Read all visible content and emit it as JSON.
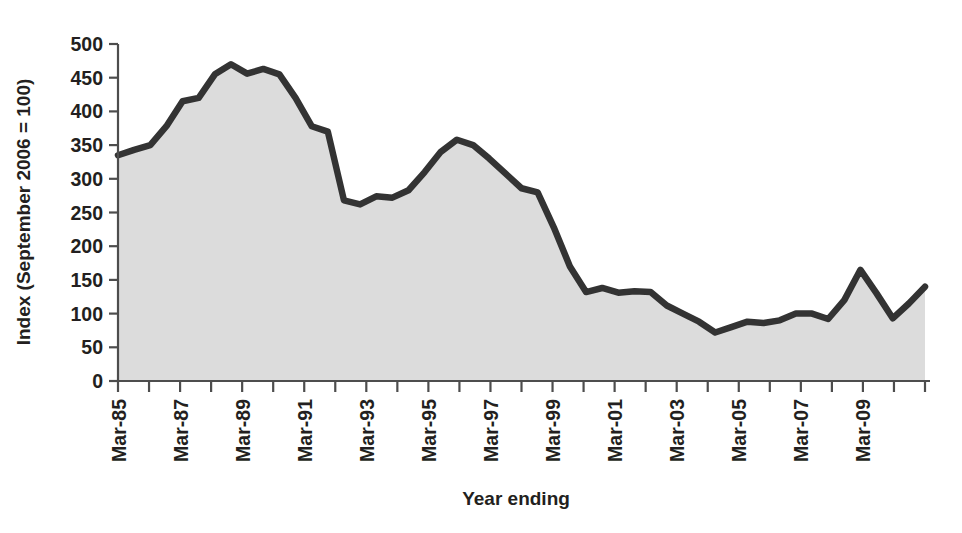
{
  "chart_data": {
    "type": "area",
    "title": "",
    "xlabel": "Year ending",
    "ylabel": "Index (September 2006 = 100)",
    "ylim": [
      0,
      500
    ],
    "ytick_step": 50,
    "yticks": [
      "0",
      "50",
      "100",
      "150",
      "200",
      "250",
      "300",
      "350",
      "400",
      "450",
      "500"
    ],
    "grid": false,
    "legend": "none",
    "xtick_labels_shown": [
      "Mar-85",
      "Mar-87",
      "Mar-89",
      "Mar-91",
      "Mar-93",
      "Mar-95",
      "Mar-97",
      "Mar-99",
      "Mar-01",
      "Mar-03",
      "Mar-05",
      "Mar-07",
      "Mar-09"
    ],
    "xtick_label_interval_years": 2,
    "xtick_rotation_deg": -90,
    "x": [
      "Mar-85",
      "Mar-86",
      "Mar-87",
      "Mar-88",
      "Mar-89",
      "Mar-90",
      "Mar-91",
      "Mar-92",
      "Mar-93",
      "Mar-94",
      "Mar-95",
      "Mar-96",
      "Mar-97",
      "Mar-98",
      "Mar-99",
      "Mar-00",
      "Mar-01",
      "Mar-02",
      "Mar-03",
      "Mar-04",
      "Mar-05",
      "Mar-06",
      "Mar-07",
      "Mar-08",
      "Mar-09",
      "Mar-10",
      "Mar-11"
    ],
    "values": [
      335,
      350,
      415,
      470,
      465,
      460,
      378,
      268,
      262,
      272,
      310,
      358,
      345,
      285,
      210,
      132,
      140,
      132,
      105,
      72,
      88,
      86,
      100,
      92,
      165,
      93,
      140
    ],
    "series": [
      {
        "name": "Index",
        "line_color": "#333333",
        "fill_color": "#dcdcdc",
        "values": [
          335,
          350,
          415,
          470,
          465,
          460,
          378,
          268,
          262,
          272,
          310,
          358,
          345,
          285,
          210,
          132,
          140,
          132,
          105,
          72,
          88,
          86,
          100,
          92,
          165,
          93,
          140
        ]
      }
    ],
    "dense_points": [
      {
        "x": "Mar-85",
        "y": 335
      },
      {
        "x": "Sep-85",
        "y": 343
      },
      {
        "x": "Mar-86",
        "y": 350
      },
      {
        "x": "Sep-86",
        "y": 378
      },
      {
        "x": "Mar-87",
        "y": 415
      },
      {
        "x": "Sep-87",
        "y": 420
      },
      {
        "x": "Mar-88",
        "y": 455
      },
      {
        "x": "Sep-88",
        "y": 470
      },
      {
        "x": "Mar-89",
        "y": 456
      },
      {
        "x": "Sep-89",
        "y": 463
      },
      {
        "x": "Mar-90",
        "y": 455
      },
      {
        "x": "Sep-90",
        "y": 420
      },
      {
        "x": "Mar-91",
        "y": 378
      },
      {
        "x": "Sep-91",
        "y": 370
      },
      {
        "x": "Mar-92",
        "y": 268
      },
      {
        "x": "Sep-92",
        "y": 262
      },
      {
        "x": "Mar-93",
        "y": 274
      },
      {
        "x": "Sep-93",
        "y": 272
      },
      {
        "x": "Mar-94",
        "y": 283
      },
      {
        "x": "Sep-94",
        "y": 310
      },
      {
        "x": "Mar-95",
        "y": 340
      },
      {
        "x": "Sep-95",
        "y": 358
      },
      {
        "x": "Mar-96",
        "y": 350
      },
      {
        "x": "Sep-96",
        "y": 330
      },
      {
        "x": "Mar-97",
        "y": 308
      },
      {
        "x": "Sep-97",
        "y": 286
      },
      {
        "x": "Mar-98",
        "y": 280
      },
      {
        "x": "Sep-98",
        "y": 228
      },
      {
        "x": "Mar-99",
        "y": 170
      },
      {
        "x": "Sep-99",
        "y": 132
      },
      {
        "x": "Mar-00",
        "y": 138
      },
      {
        "x": "Sep-00",
        "y": 131
      },
      {
        "x": "Mar-01",
        "y": 133
      },
      {
        "x": "Sep-01",
        "y": 132
      },
      {
        "x": "Mar-02",
        "y": 112
      },
      {
        "x": "Sep-02",
        "y": 100
      },
      {
        "x": "Mar-03",
        "y": 88
      },
      {
        "x": "Sep-03",
        "y": 72
      },
      {
        "x": "Mar-04",
        "y": 80
      },
      {
        "x": "Sep-04",
        "y": 88
      },
      {
        "x": "Mar-05",
        "y": 86
      },
      {
        "x": "Sep-05",
        "y": 90
      },
      {
        "x": "Mar-06",
        "y": 100
      },
      {
        "x": "Sep-06",
        "y": 100
      },
      {
        "x": "Mar-07",
        "y": 92
      },
      {
        "x": "Sep-07",
        "y": 120
      },
      {
        "x": "Mar-08",
        "y": 165
      },
      {
        "x": "Sep-08",
        "y": 130
      },
      {
        "x": "Mar-09",
        "y": 93
      },
      {
        "x": "Sep-09",
        "y": 115
      },
      {
        "x": "Mar-10",
        "y": 140
      }
    ]
  },
  "axes": {
    "y_axis_title": "Index (September 2006 = 100)",
    "x_axis_title": "Year ending"
  },
  "colors": {
    "line": "#333333",
    "fill": "#dcdcdc",
    "axis": "#4d4d4d",
    "text": "#231f20"
  }
}
